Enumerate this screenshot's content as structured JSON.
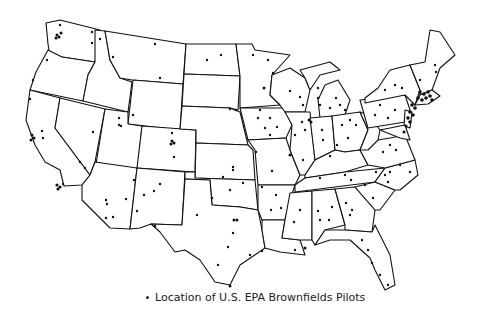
{
  "map": {
    "title": "Location of U.S. EPA Brownfields Pilots",
    "region": "Contiguous United States",
    "marker": "dot",
    "colors": {
      "outline": "#111111",
      "fill": "#ffffff",
      "marker": "#111111"
    }
  },
  "legend": {
    "bullet_icon": "dot-marker",
    "label": "Location of U.S. EPA Brownfields Pilots"
  }
}
